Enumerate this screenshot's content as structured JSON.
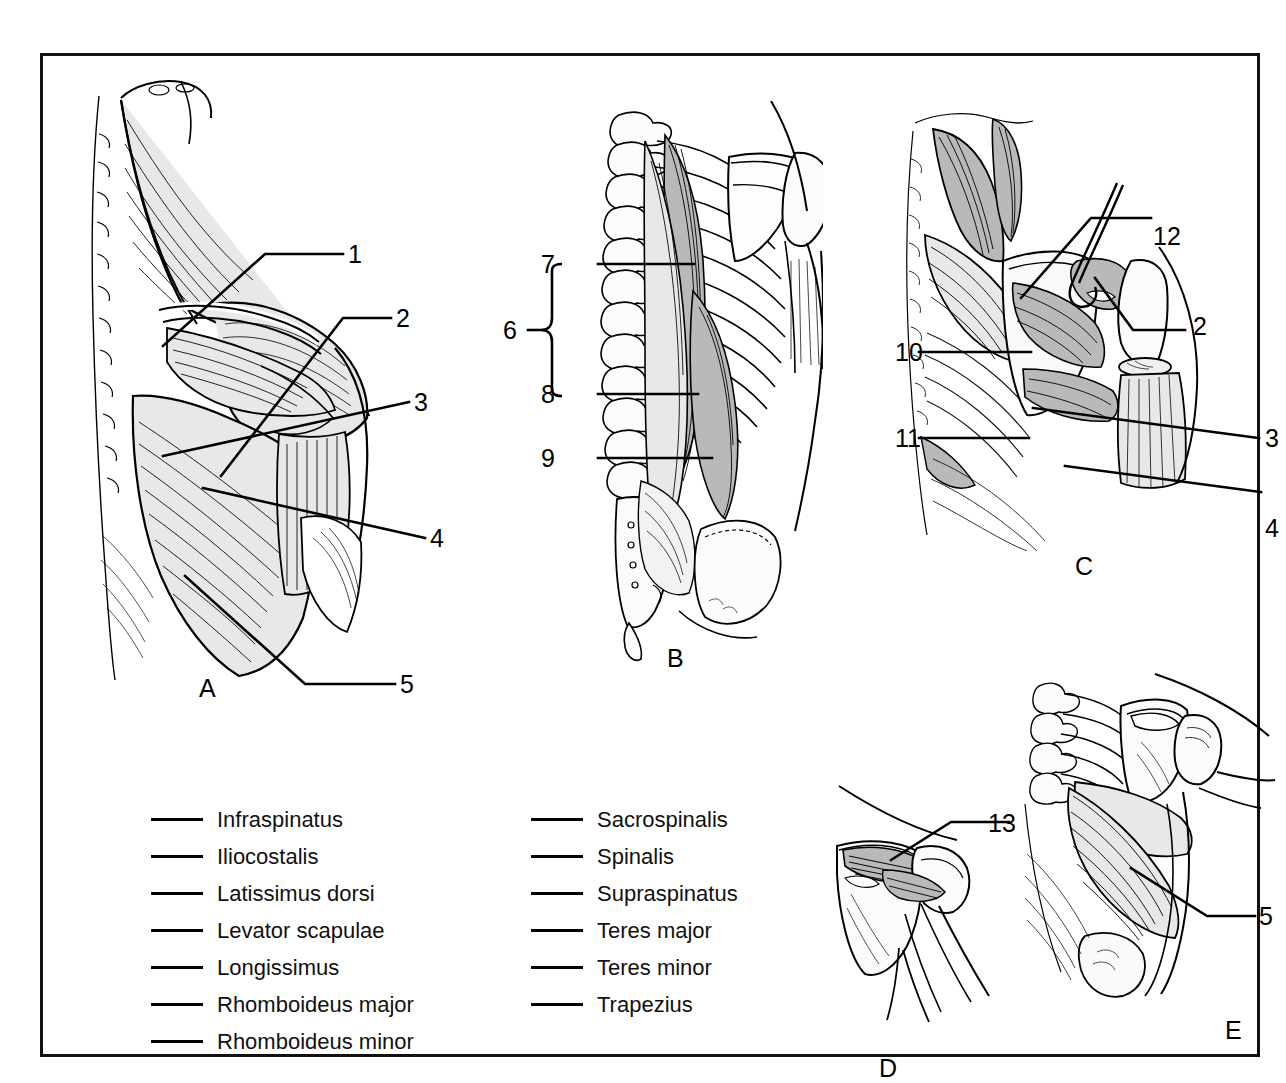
{
  "figure": {
    "panel_letters": [
      "A",
      "B",
      "C",
      "D",
      "E"
    ],
    "border_color": "#111111",
    "background_color": "#ffffff"
  },
  "panels": {
    "A": {
      "letter": "A",
      "caption_letter": "A",
      "numbers": [
        "1",
        "2",
        "3",
        "4",
        "5"
      ]
    },
    "B": {
      "letter": "B",
      "caption_letter": "B",
      "numbers": [
        "6",
        "7",
        "8",
        "9"
      ],
      "bracket_label": "6",
      "bracket_members": [
        "7",
        "8",
        "9"
      ]
    },
    "C": {
      "letter": "C",
      "caption_letter": "C",
      "numbers": [
        "10",
        "11",
        "12",
        "2",
        "3",
        "4"
      ]
    },
    "D": {
      "letter": "D",
      "caption_letter": "D",
      "numbers": [
        "13"
      ]
    },
    "E": {
      "letter": "E",
      "caption_letter": "E",
      "numbers": [
        "5"
      ]
    }
  },
  "labels": {
    "a1": "1",
    "a2": "2",
    "a3": "3",
    "a4": "4",
    "a5": "5",
    "b6": "6",
    "b7": "7",
    "b8": "8",
    "b9": "9",
    "c10": "10",
    "c11": "11",
    "c12": "12",
    "c2": "2",
    "c3": "3",
    "c4": "4",
    "d13": "13",
    "e5": "5"
  },
  "word_list": {
    "left_column": [
      "Infraspinatus",
      "Iliocostalis",
      "Latissimus dorsi",
      "Levator scapulae",
      "Longissimus",
      "Rhomboideus major",
      "Rhomboideus minor"
    ],
    "right_column": [
      "Sacrospinalis",
      "Spinalis",
      "Supraspinatus",
      "Teres major",
      "Teres minor",
      "Trapezius"
    ]
  }
}
